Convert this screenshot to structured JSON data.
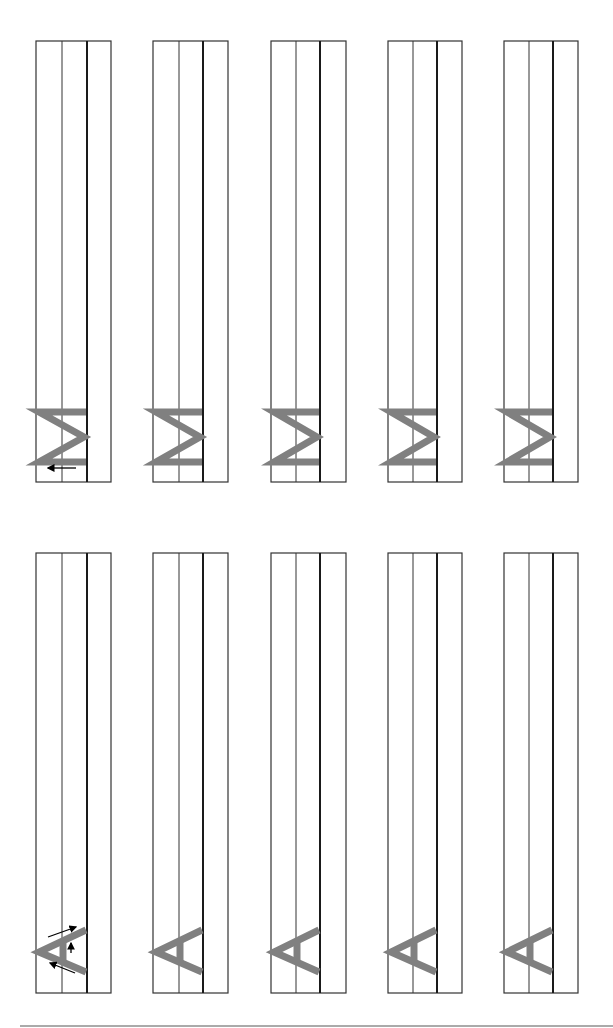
{
  "worksheet": {
    "type": "handwriting-practice",
    "orientation": "rotated-90",
    "letter_color": "#808080",
    "line_color": "#333333",
    "baseline_color": "#1a1a1a",
    "arrow_color": "#000000",
    "rows": [
      {
        "letter": "M",
        "has_stroke_arrows": true,
        "columns": [
          {
            "x": [
              36,
              62,
              87,
              111
            ],
            "top": 41,
            "bottom": 482
          },
          {
            "x": [
              153,
              179,
              203,
              228
            ],
            "top": 41,
            "bottom": 482
          },
          {
            "x": [
              271,
              296,
              320,
              346
            ],
            "top": 41,
            "bottom": 482
          },
          {
            "x": [
              388,
              413,
              437,
              462
            ],
            "top": 41,
            "bottom": 482
          },
          {
            "x": [
              504,
              529,
              553,
              578
            ],
            "top": 41,
            "bottom": 482
          }
        ]
      },
      {
        "letter": "A",
        "has_stroke_arrows": true,
        "columns": [
          {
            "x": [
              36,
              62,
              87,
              111
            ],
            "top": 553,
            "bottom": 993
          },
          {
            "x": [
              153,
              179,
              203,
              228
            ],
            "top": 553,
            "bottom": 993
          },
          {
            "x": [
              271,
              296,
              320,
              346
            ],
            "top": 553,
            "bottom": 993
          },
          {
            "x": [
              388,
              413,
              437,
              462
            ],
            "top": 553,
            "bottom": 993
          },
          {
            "x": [
              504,
              529,
              553,
              578
            ],
            "top": 553,
            "bottom": 993
          }
        ]
      }
    ],
    "footer_rule": {
      "x1": 20,
      "x2": 613,
      "y": 1026,
      "color": "#aaaaaa"
    }
  }
}
